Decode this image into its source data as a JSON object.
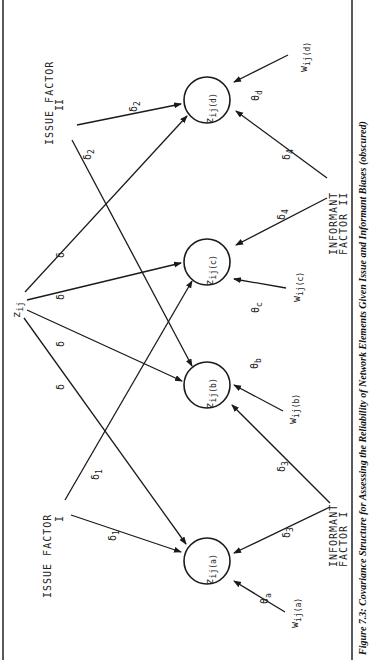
{
  "figure": {
    "caption": "Figure 7.3: Covariance Structure for Assessing the Reliability of Network Elements Given Issue and Informant Biases (obscured)",
    "orientation": "rotated 90 degrees counter-clockwise (landscape page)"
  },
  "source": {
    "label": "z",
    "sub": "ij"
  },
  "factors": {
    "issue_1": {
      "line1": "ISSUE FACTOR",
      "line2": "I"
    },
    "issue_2": {
      "line1": "ISSUE FACTOR",
      "line2": "II"
    },
    "informant_1": {
      "line1": "INFORMANT",
      "line2": "FACTOR I"
    },
    "informant_2": {
      "line1": "INFORMANT",
      "line2": "FACTOR II"
    }
  },
  "nodes": [
    {
      "id": "a",
      "label": "z",
      "sub": "ij(a)"
    },
    {
      "id": "b",
      "label": "z",
      "sub": "ij(b)"
    },
    {
      "id": "c",
      "label": "z",
      "sub": "ij(c)"
    },
    {
      "id": "d",
      "label": "z",
      "sub": "ij(d)"
    }
  ],
  "errors": [
    {
      "id": "a",
      "w": "w",
      "wsub": "ij(a)",
      "theta": "θ",
      "tsub": "a"
    },
    {
      "id": "b",
      "w": "w",
      "wsub": "ij(b)",
      "theta": "θ",
      "tsub": "b"
    },
    {
      "id": "c",
      "w": "w",
      "wsub": "ij(c)",
      "theta": "θ",
      "tsub": "c"
    },
    {
      "id": "d",
      "w": "w",
      "wsub": "ij(d)",
      "theta": "θ",
      "tsub": "d"
    }
  ],
  "edge_labels": {
    "delta": "δ",
    "delta1": "δ1",
    "delta2": "δ2",
    "delta3": "δ3",
    "delta4": "δ4",
    "d_sym": "δ",
    "s1": "1",
    "s2": "2",
    "s3": "3",
    "s4": "4"
  }
}
